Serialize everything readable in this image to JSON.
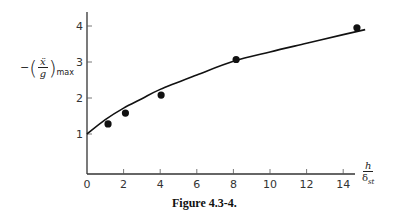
{
  "chart_data": {
    "type": "scatter",
    "title": "",
    "caption": "Figure 4.3-4.",
    "xlabel": "h/δst",
    "ylabel": "−(ẍ/g)max",
    "xlim": [
      0,
      15.5
    ],
    "ylim": [
      0,
      4.4
    ],
    "xticks": [
      0,
      2,
      4,
      6,
      8,
      10,
      12,
      14
    ],
    "yticks": [
      1,
      2,
      3,
      4
    ],
    "grid": false,
    "legend": null,
    "series": [
      {
        "name": "measured points",
        "type": "scatter",
        "x": [
          1.15,
          2.1,
          4.05,
          8.15,
          14.75
        ],
        "y": [
          1.28,
          1.58,
          2.08,
          3.07,
          3.95
        ]
      },
      {
        "name": "theoretical curve",
        "type": "line",
        "x": [
          0,
          1,
          2,
          3,
          4,
          6,
          8,
          10,
          12,
          14,
          15.2
        ],
        "y": [
          1.0,
          1.4,
          1.72,
          1.98,
          2.24,
          2.64,
          3.02,
          3.28,
          3.52,
          3.76,
          3.9
        ]
      }
    ]
  },
  "labels": {
    "ylabel_minus": "−",
    "ylabel_open": "(",
    "ylabel_num": "ẍ",
    "ylabel_den": "g",
    "ylabel_close": ")",
    "ylabel_sub": "max",
    "xlabel_num": "h",
    "xlabel_den": "δ",
    "xlabel_den_sub": "st",
    "caption": "Figure 4.3-4."
  }
}
